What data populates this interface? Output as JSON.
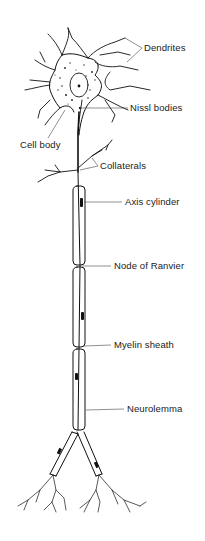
{
  "diagram": {
    "labels": {
      "dendrites": "Dendrites",
      "nissl_bodies": "Nissl bodies",
      "cell_body": "Cell body",
      "collaterals": "Collaterals",
      "axis_cylinder": "Axis cylinder",
      "node_of_ranvier": "Node of Ranvier",
      "myelin_sheath": "Myelin sheath",
      "neurolemma": "Neurolemma"
    },
    "colors": {
      "ink": "#111111",
      "background": "#ffffff"
    }
  }
}
